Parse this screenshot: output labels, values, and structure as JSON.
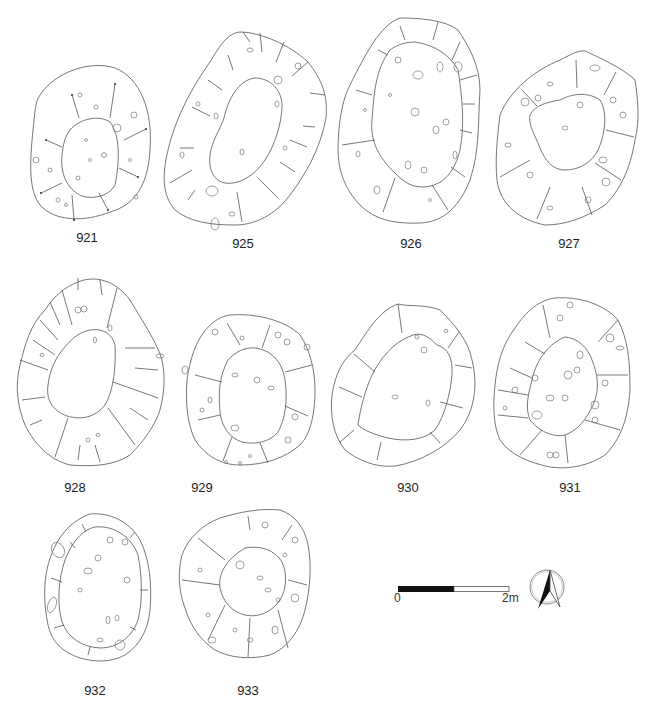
{
  "figure": {
    "type": "archaeological-plan-drawings",
    "features": [
      {
        "id": "921",
        "label": "921",
        "row": 1,
        "col": 1
      },
      {
        "id": "925",
        "label": "925",
        "row": 1,
        "col": 2
      },
      {
        "id": "926",
        "label": "926",
        "row": 1,
        "col": 3
      },
      {
        "id": "927",
        "label": "927",
        "row": 1,
        "col": 4
      },
      {
        "id": "928",
        "label": "928",
        "row": 2,
        "col": 1
      },
      {
        "id": "929",
        "label": "929",
        "row": 2,
        "col": 2
      },
      {
        "id": "930",
        "label": "930",
        "row": 2,
        "col": 3
      },
      {
        "id": "931",
        "label": "931",
        "row": 2,
        "col": 4
      },
      {
        "id": "932",
        "label": "932",
        "row": 3,
        "col": 1
      },
      {
        "id": "933",
        "label": "933",
        "row": 3,
        "col": 2
      }
    ],
    "scale_bar": {
      "start_label": "0",
      "end_label": "2m"
    },
    "north_arrow": {
      "icon": "north-arrow-icon"
    }
  }
}
